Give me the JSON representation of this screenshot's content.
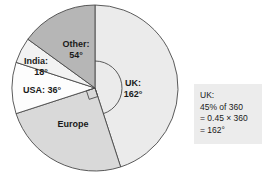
{
  "chart_data": {
    "type": "pie",
    "title": "",
    "subtitle": "",
    "xlabel": "",
    "ylabel": "",
    "legend_position": "none",
    "grid": false,
    "total_degrees": 360,
    "start_angle_deg": 0,
    "direction": "clockwise",
    "categories": [
      "UK",
      "Europe",
      "USA",
      "India",
      "Other"
    ],
    "values": [
      162,
      90,
      36,
      18,
      54
    ],
    "units": "degrees",
    "center": {
      "x": 95,
      "y": 88
    },
    "radius": 83,
    "slices": [
      {
        "name": "UK",
        "label": "UK:",
        "value_label": "162°",
        "degrees": 162,
        "color": "#ebebeb",
        "label_x": 133,
        "label_y": 84,
        "value_x": 133,
        "value_y": 95
      },
      {
        "name": "Europe",
        "label": "Europe",
        "value_label": "",
        "degrees": 90,
        "color": "#d9d9d9",
        "label_x": 73,
        "label_y": 125,
        "value_x": 0,
        "value_y": 0
      },
      {
        "name": "USA",
        "label": "USA: 36°",
        "value_label": "",
        "degrees": 36,
        "color": "#fdfdfd",
        "label_x": 42,
        "label_y": 91,
        "value_x": 0,
        "value_y": 0
      },
      {
        "name": "India",
        "label": "India:",
        "value_label": "18°",
        "degrees": 18,
        "color": "#f2f2f2",
        "label_x": 36,
        "label_y": 62,
        "value_x": 41,
        "value_y": 73
      },
      {
        "name": "Other",
        "label": "Other:",
        "value_label": "54°",
        "degrees": 54,
        "color": "#b6b6b6",
        "label_x": 76,
        "label_y": 45,
        "value_x": 76,
        "value_y": 56
      }
    ],
    "annotations": {
      "angle_arc": {
        "name": "uk-angle-arc",
        "from_deg": 0,
        "to_deg": 162,
        "radius": 27
      },
      "right_angle_marker": {
        "name": "europe-right-angle-marker",
        "at_deg": 162
      }
    }
  },
  "callout": {
    "lines": [
      "UK:",
      "45% of 360",
      "= 0.45 × 360",
      "= 162°"
    ],
    "background": "#ececec"
  }
}
